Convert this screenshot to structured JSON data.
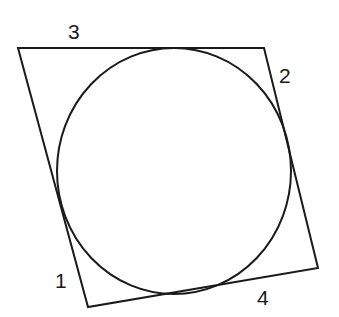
{
  "diagram": {
    "stroke_color": "#1a1a1a",
    "background": "#ffffff",
    "quadrilateral": {
      "vertices": [
        [
          18,
          48
        ],
        [
          264,
          48
        ],
        [
          318,
          268
        ],
        [
          88,
          307
        ]
      ]
    },
    "circle": {
      "cx": 174,
      "cy": 171,
      "rx": 117,
      "ry": 123
    },
    "labels": {
      "side_1": "1",
      "side_2": "2",
      "side_3": "3",
      "side_4": "4"
    }
  }
}
